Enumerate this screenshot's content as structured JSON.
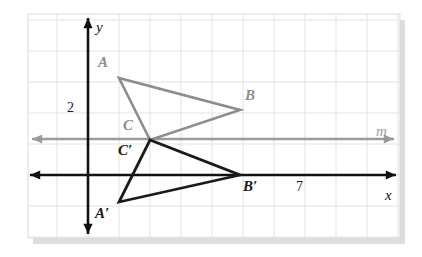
{
  "figure": {
    "type": "coordinate-geometry-diagram",
    "background": "#ffffff",
    "panel": {
      "x": 28,
      "y": 14,
      "width": 372,
      "height": 224,
      "fill": "#ffffff",
      "border_color": "#d9d9d9",
      "shadow_color": "#b3b3b3"
    },
    "grid": {
      "spacing": 31,
      "color": "#e2e2e2",
      "visible": true,
      "origin_x": 88,
      "origin_y": 175
    }
  },
  "axes": {
    "color": "#111111",
    "x_axis": {
      "name": "x-axis",
      "y": 175,
      "x_start": 30,
      "x_end": 396,
      "label": "x",
      "label_x": 385,
      "label_y": 188,
      "arrow_left": true,
      "arrow_right": true
    },
    "y_axis": {
      "name": "y-axis",
      "x": 88,
      "y_start": 18,
      "y_end": 234,
      "label": "y",
      "label_x": 96,
      "label_y": 20,
      "arrow_up": true,
      "arrow_down": true
    }
  },
  "line_m": {
    "name": "line-m",
    "color": "#9a9a9a",
    "y": 139,
    "x_start": 32,
    "x_end": 394,
    "label": "m",
    "label_x": 376,
    "label_y": 124,
    "arrow_left": true,
    "arrow_right": true
  },
  "tick_labels": [
    {
      "text": "2",
      "x": 67,
      "y": 101,
      "axis": "y"
    },
    {
      "text": "7",
      "x": 296,
      "y": 180,
      "axis": "x"
    }
  ],
  "triangles": [
    {
      "name": "triangle-ABC",
      "color": "#8c8c8c",
      "stroke_width": 2.6,
      "vertices": [
        {
          "label": "A",
          "x": 119,
          "y": 78,
          "label_x": 98,
          "label_y": 55
        },
        {
          "label": "B",
          "x": 240,
          "y": 110,
          "label_x": 245,
          "label_y": 88
        },
        {
          "label": "C",
          "x": 150,
          "y": 140,
          "label_x": 123,
          "label_y": 118
        }
      ]
    },
    {
      "name": "triangle-A-prime-B-prime-C-prime",
      "color": "#1a1a1a",
      "stroke_width": 2.8,
      "vertices": [
        {
          "label": "A′",
          "x": 119,
          "y": 202,
          "label_x": 95,
          "label_y": 206
        },
        {
          "label": "B′",
          "x": 240,
          "y": 175,
          "label_x": 243,
          "label_y": 179
        },
        {
          "label": "C′",
          "x": 150,
          "y": 140,
          "label_x": 118,
          "label_y": 143
        }
      ]
    }
  ]
}
